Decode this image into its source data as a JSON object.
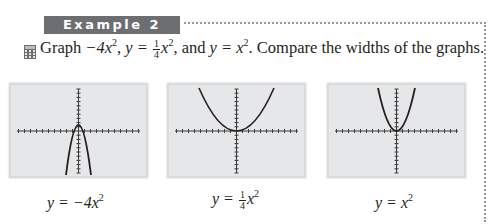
{
  "example": {
    "label": "Example 2"
  },
  "prompt": {
    "icon": "calculator-icon",
    "text_graph": "Graph",
    "eq1": "−4x",
    "eq2_lhs": "y = ",
    "eq2_num": "1",
    "eq2_den": "4",
    "eq2_var": "x",
    "eq3": "y = x",
    "exp": "2",
    "and": "and",
    "compare": "Compare the widths of the graphs."
  },
  "graphs": [
    {
      "caption_lhs": "y = −4x",
      "caption_exp": "2",
      "coefficient": -4
    },
    {
      "caption_lhs": "y = ",
      "caption_num": "1",
      "caption_den": "4",
      "caption_var": "x",
      "caption_exp": "2",
      "coefficient": 0.25
    },
    {
      "caption_lhs": "y = x",
      "caption_exp": "2",
      "coefficient": 1
    }
  ],
  "colors": {
    "badge": "#6d6e71",
    "panel": "#e6e7e8",
    "curve": "#231f20",
    "dots": "#9a9a9a"
  }
}
